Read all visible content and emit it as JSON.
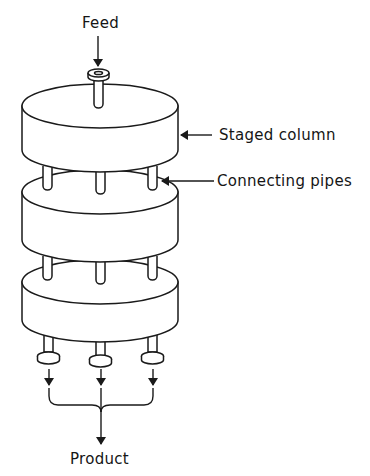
{
  "diagram": {
    "type": "staged column schematic",
    "stages": 3,
    "labels": {
      "feed": "Feed",
      "staged_column": "Staged column",
      "connecting_pipes": "Connecting pipes",
      "product": "Product"
    },
    "outlets": 3,
    "connecting_pipes_per_joint": 3,
    "colors": {
      "line": "#1a1a1a",
      "background": "#ffffff"
    }
  }
}
